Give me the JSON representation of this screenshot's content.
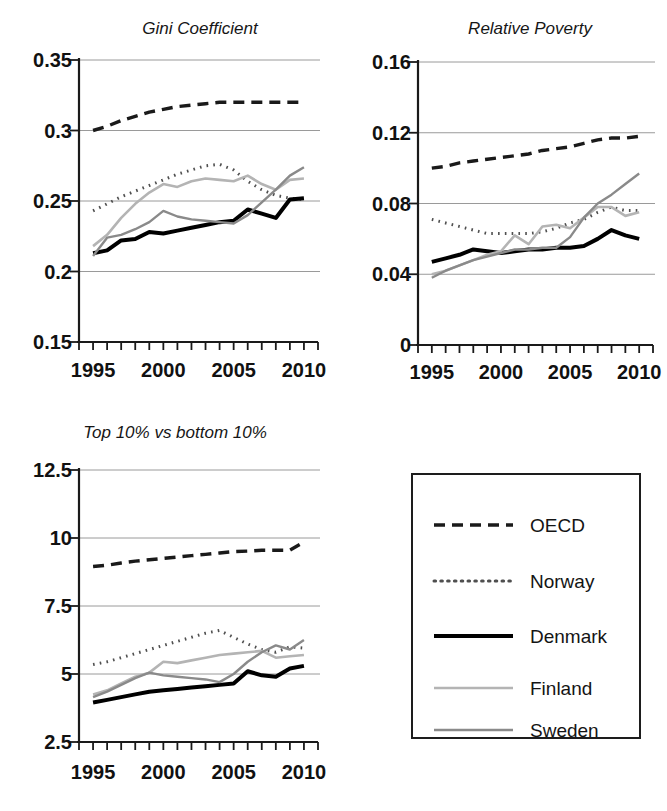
{
  "figure": {
    "background": "#ffffff",
    "panels": [
      "Gini Coefficient",
      "Relative Poverty",
      "Top 10% vs bottom 10%",
      "legend"
    ]
  },
  "legend": {
    "name": "series-legend",
    "entries": [
      {
        "label": "OECD",
        "style": "dashed",
        "color": "#1a1a1a",
        "width": 3.4,
        "dash": "11,7"
      },
      {
        "label": "Norway",
        "style": "dotted",
        "color": "#4f4f4f",
        "width": 3.0,
        "dash": "1.6,5.2"
      },
      {
        "label": "Denmark",
        "style": "solid",
        "color": "#000000",
        "width": 4.0,
        "dash": ""
      },
      {
        "label": "Finland",
        "style": "solid",
        "color": "#b4b4b4",
        "width": 2.6,
        "dash": ""
      },
      {
        "label": "Sweden",
        "style": "solid",
        "color": "#8a8a8a",
        "width": 2.4,
        "dash": ""
      }
    ]
  },
  "chart_data": [
    {
      "id": "gini",
      "type": "line",
      "title": "Gini Coefficient",
      "xlabel": "",
      "ylabel": "",
      "xlim": [
        1994,
        2011
      ],
      "ylim": [
        0.15,
        0.35
      ],
      "yticks": [
        0.15,
        0.2,
        0.25,
        0.3,
        0.35
      ],
      "ytick_labels": [
        "0.15",
        "0.2",
        "0.25",
        "0.3",
        "0.35"
      ],
      "xticks": [
        1995,
        2000,
        2005,
        2010
      ],
      "xtick_labels": [
        "1995",
        "2000",
        "2005",
        "2010"
      ],
      "xminor_ticks": [
        1994,
        1995,
        1996,
        1997,
        1998,
        1999,
        2000,
        2001,
        2002,
        2003,
        2004,
        2005,
        2006,
        2007,
        2008,
        2009,
        2010,
        2011
      ],
      "grid": "horizontal",
      "x": [
        1995,
        1996,
        1997,
        1998,
        1999,
        2000,
        2001,
        2002,
        2003,
        2004,
        2005,
        2006,
        2007,
        2008,
        2009,
        2010
      ],
      "series": [
        {
          "name": "OECD",
          "values": [
            0.3,
            0.303,
            0.307,
            0.31,
            0.313,
            0.315,
            0.317,
            0.318,
            0.319,
            0.32,
            0.32,
            0.32,
            0.32,
            0.32,
            0.32,
            0.32
          ]
        },
        {
          "name": "Norway",
          "values": [
            0.243,
            0.248,
            0.253,
            0.257,
            0.261,
            0.265,
            0.269,
            0.272,
            0.275,
            0.276,
            0.272,
            0.264,
            0.258,
            0.254,
            0.252,
            0.251
          ]
        },
        {
          "name": "Denmark",
          "values": [
            0.213,
            0.215,
            0.222,
            0.223,
            0.228,
            0.227,
            0.229,
            0.231,
            0.233,
            0.235,
            0.236,
            0.244,
            0.241,
            0.238,
            0.251,
            0.252
          ]
        },
        {
          "name": "Finland",
          "values": [
            0.218,
            0.226,
            0.238,
            0.248,
            0.256,
            0.262,
            0.26,
            0.264,
            0.266,
            0.265,
            0.264,
            0.268,
            0.262,
            0.258,
            0.265,
            0.266
          ]
        },
        {
          "name": "Sweden",
          "values": [
            0.211,
            0.224,
            0.226,
            0.23,
            0.235,
            0.243,
            0.239,
            0.237,
            0.236,
            0.235,
            0.234,
            0.24,
            0.249,
            0.258,
            0.268,
            0.274
          ]
        }
      ]
    },
    {
      "id": "poverty",
      "type": "line",
      "title": "Relative Poverty",
      "xlabel": "",
      "ylabel": "",
      "xlim": [
        1994,
        2011
      ],
      "ylim": [
        0,
        0.16
      ],
      "yticks": [
        0,
        0.04,
        0.08,
        0.12,
        0.16
      ],
      "ytick_labels": [
        "0",
        "0.04",
        "0.08",
        "0.12",
        "0.16"
      ],
      "xticks": [
        1995,
        2000,
        2005,
        2010
      ],
      "xtick_labels": [
        "1995",
        "2000",
        "2005",
        "2010"
      ],
      "xminor_ticks": [
        1994,
        1995,
        1996,
        1997,
        1998,
        1999,
        2000,
        2001,
        2002,
        2003,
        2004,
        2005,
        2006,
        2007,
        2008,
        2009,
        2010,
        2011
      ],
      "grid": "horizontal",
      "x": [
        1995,
        1996,
        1997,
        1998,
        1999,
        2000,
        2001,
        2002,
        2003,
        2004,
        2005,
        2006,
        2007,
        2008,
        2009,
        2010
      ],
      "series": [
        {
          "name": "OECD",
          "values": [
            0.1,
            0.101,
            0.103,
            0.104,
            0.105,
            0.106,
            0.107,
            0.108,
            0.11,
            0.111,
            0.112,
            0.114,
            0.116,
            0.117,
            0.117,
            0.118
          ]
        },
        {
          "name": "Norway",
          "values": [
            0.071,
            0.069,
            0.067,
            0.065,
            0.063,
            0.063,
            0.063,
            0.063,
            0.064,
            0.066,
            0.069,
            0.071,
            0.075,
            0.078,
            0.076,
            0.076
          ]
        },
        {
          "name": "Denmark",
          "values": [
            0.047,
            0.049,
            0.051,
            0.054,
            0.053,
            0.052,
            0.053,
            0.054,
            0.054,
            0.055,
            0.055,
            0.056,
            0.06,
            0.065,
            0.062,
            0.06
          ]
        },
        {
          "name": "Finland",
          "values": [
            0.04,
            0.042,
            0.045,
            0.048,
            0.051,
            0.053,
            0.062,
            0.057,
            0.067,
            0.068,
            0.066,
            0.072,
            0.078,
            0.078,
            0.073,
            0.075
          ]
        },
        {
          "name": "Sweden",
          "values": [
            0.038,
            0.042,
            0.045,
            0.048,
            0.05,
            0.052,
            0.054,
            0.054,
            0.055,
            0.055,
            0.061,
            0.072,
            0.08,
            0.085,
            0.091,
            0.097
          ]
        }
      ]
    },
    {
      "id": "ratio",
      "type": "line",
      "title": "Top 10% vs bottom 10%",
      "xlabel": "",
      "ylabel": "",
      "xlim": [
        1994,
        2011
      ],
      "ylim": [
        2.5,
        12.5
      ],
      "yticks": [
        2.5,
        5,
        7.5,
        10,
        12.5
      ],
      "ytick_labels": [
        "2.5",
        "5",
        "7.5",
        "10",
        "12.5"
      ],
      "xticks": [
        1995,
        2000,
        2005,
        2010
      ],
      "xtick_labels": [
        "1995",
        "2000",
        "2005",
        "2010"
      ],
      "xminor_ticks": [
        1994,
        1995,
        1996,
        1997,
        1998,
        1999,
        2000,
        2001,
        2002,
        2003,
        2004,
        2005,
        2006,
        2007,
        2008,
        2009,
        2010,
        2011
      ],
      "grid": "horizontal",
      "x": [
        1995,
        1996,
        1997,
        1998,
        1999,
        2000,
        2001,
        2002,
        2003,
        2004,
        2005,
        2006,
        2007,
        2008,
        2009,
        2010
      ],
      "series": [
        {
          "name": "OECD",
          "values": [
            8.95,
            9.0,
            9.08,
            9.15,
            9.2,
            9.25,
            9.3,
            9.35,
            9.4,
            9.45,
            9.5,
            9.52,
            9.55,
            9.55,
            9.55,
            9.85
          ]
        },
        {
          "name": "Norway",
          "values": [
            5.35,
            5.45,
            5.6,
            5.75,
            5.9,
            6.05,
            6.2,
            6.35,
            6.5,
            6.6,
            6.35,
            6.1,
            5.9,
            5.8,
            6.0,
            5.95
          ]
        },
        {
          "name": "Denmark",
          "values": [
            3.95,
            4.05,
            4.15,
            4.25,
            4.35,
            4.4,
            4.45,
            4.5,
            4.55,
            4.6,
            4.65,
            5.1,
            4.95,
            4.9,
            5.2,
            5.3
          ]
        },
        {
          "name": "Finland",
          "values": [
            4.25,
            4.4,
            4.65,
            4.9,
            5.05,
            5.45,
            5.4,
            5.5,
            5.6,
            5.7,
            5.75,
            5.8,
            5.85,
            5.6,
            5.65,
            5.7
          ]
        },
        {
          "name": "Sweden",
          "values": [
            4.15,
            4.35,
            4.6,
            4.85,
            5.05,
            4.95,
            4.9,
            4.85,
            4.8,
            4.7,
            5.0,
            5.45,
            5.8,
            6.05,
            5.9,
            6.25
          ]
        }
      ]
    }
  ]
}
